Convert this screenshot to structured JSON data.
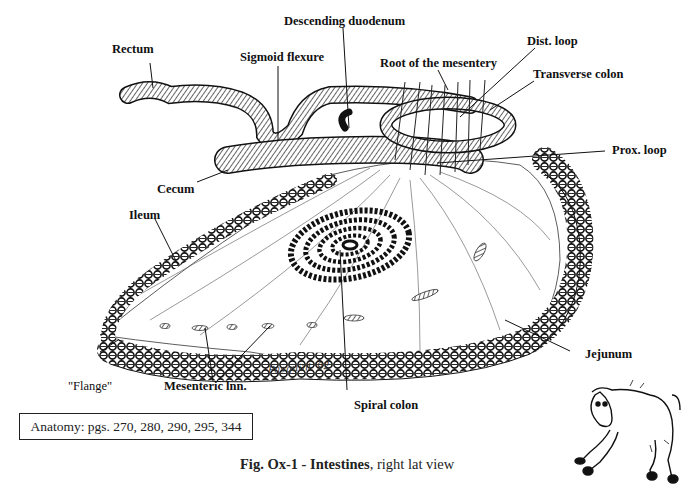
{
  "figure": {
    "caption_bold": "Fig. Ox-1 - Intestines",
    "caption_rest": ", right lat view",
    "reference": "Anatomy: pgs. 270, 280, 290, 295, 344",
    "signature": "Pasquini '92"
  },
  "labels": {
    "rectum": "Rectum",
    "sigmoid_flexure": "Sigmoid flexure",
    "descending_duodenum": "Descending duodenum",
    "dist_loop": "Dist. loop",
    "root_of_mesentery": "Root of the mesentery",
    "transverse_colon": "Transverse colon",
    "prox_loop": "Prox. loop",
    "cecum": "Cecum",
    "ileum": "Ileum",
    "jejunum": "Jejunum",
    "flange": "\"Flange\"",
    "mesenteric_lnn": "Mesenteric lnn.",
    "spiral_colon": "Spiral colon"
  },
  "illustrations": {
    "main": "ox-intestines-drawing",
    "corner": "cartoon-cow"
  }
}
